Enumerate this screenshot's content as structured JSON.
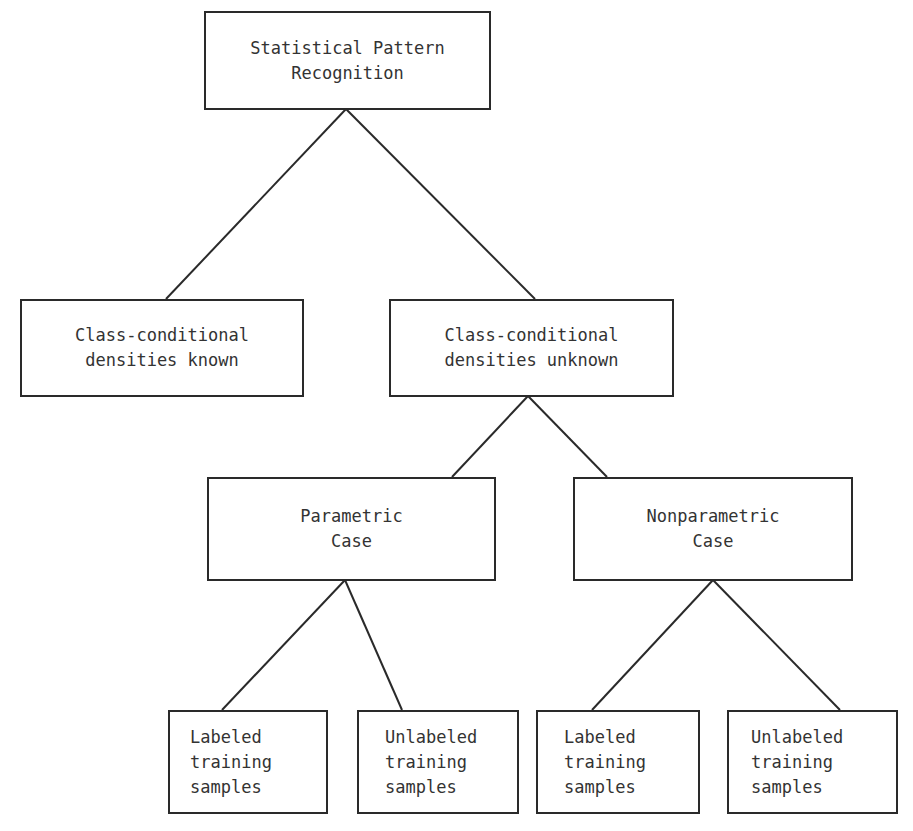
{
  "diagram": {
    "type": "tree",
    "nodes": [
      {
        "id": "root",
        "lines": [
          "Statistical Pattern",
          "Recognition"
        ]
      },
      {
        "id": "known",
        "lines": [
          "Class-conditional",
          "densities known"
        ]
      },
      {
        "id": "unknown",
        "lines": [
          "Class-conditional",
          "densities unknown"
        ]
      },
      {
        "id": "parametric",
        "lines": [
          "Parametric",
          "Case"
        ]
      },
      {
        "id": "nonparametric",
        "lines": [
          "Nonparametric",
          "Case"
        ]
      },
      {
        "id": "param-labeled",
        "lines": [
          "Labeled",
          "training",
          "samples"
        ]
      },
      {
        "id": "param-unlabeled",
        "lines": [
          "Unlabeled",
          "training",
          "samples"
        ]
      },
      {
        "id": "nonparam-labeled",
        "lines": [
          "Labeled",
          "training",
          "samples"
        ]
      },
      {
        "id": "nonparam-unlabeled",
        "lines": [
          "Unlabeled",
          "training",
          "samples"
        ]
      }
    ],
    "edges": [
      [
        "root",
        "known"
      ],
      [
        "root",
        "unknown"
      ],
      [
        "unknown",
        "parametric"
      ],
      [
        "unknown",
        "nonparametric"
      ],
      [
        "parametric",
        "param-labeled"
      ],
      [
        "parametric",
        "param-unlabeled"
      ],
      [
        "nonparametric",
        "nonparam-labeled"
      ],
      [
        "nonparametric",
        "nonparam-unlabeled"
      ]
    ]
  }
}
